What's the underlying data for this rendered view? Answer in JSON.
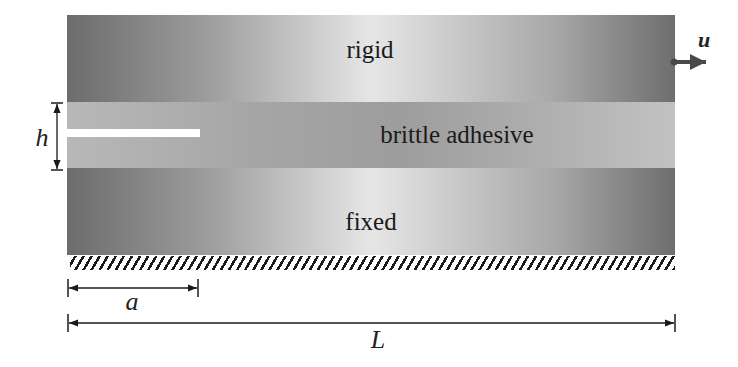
{
  "diagram": {
    "layers": {
      "top": "rigid",
      "middle": "brittle adhesive",
      "bottom": "fixed"
    },
    "dimensions": {
      "thickness": "h",
      "crack_length": "a",
      "length": "L"
    },
    "load": {
      "displacement": "u"
    },
    "colors": {
      "dark_gray": "#6c6c6c",
      "light_gray": "#e6e6e6",
      "adhesive": "#a6a6a6",
      "crack": "#ffffff",
      "ink": "#1a1a1a",
      "arrow": "#4a4a4a"
    }
  }
}
